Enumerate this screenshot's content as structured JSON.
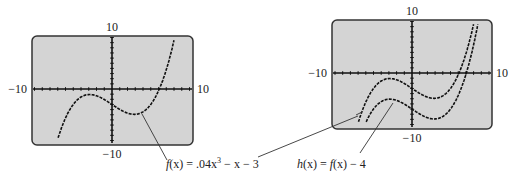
{
  "chart_data": [
    {
      "type": "line",
      "title": "",
      "xlabel": "",
      "ylabel": "",
      "xlim": [
        -10,
        10
      ],
      "ylim": [
        -10,
        10
      ],
      "tick_labels": {
        "x_min": "−10",
        "x_max": "10",
        "y_min": "−10",
        "y_max": "10"
      },
      "grid": false,
      "series": [
        {
          "name": "f(x) = .04x³ − x − 3",
          "expr": "0.04*x^3 - x - 3"
        }
      ],
      "annotations": [
        {
          "text": "f(x) = .04x³ − x − 3",
          "points_to": "f(x) local minimum near (2.9, -4.9)"
        }
      ]
    },
    {
      "type": "line",
      "title": "",
      "xlabel": "",
      "ylabel": "",
      "xlim": [
        -10,
        10
      ],
      "ylim": [
        -10,
        10
      ],
      "tick_labels": {
        "x_min": "−10",
        "x_max": "10",
        "y_min": "−10",
        "y_max": "10"
      },
      "grid": false,
      "series": [
        {
          "name": "f(x)",
          "expr": "0.04*x^3 - x - 3"
        },
        {
          "name": "h(x) = f(x) − 4",
          "expr": "0.04*x^3 - x - 7"
        }
      ],
      "annotations": [
        {
          "text": "h(x) = f(x) − 4",
          "points_to": "h(x) local maximum near (-2.9, -5.1)"
        },
        {
          "text": "f(x) = .04x³ − x − 3",
          "points_to": "f(x) left branch in right screen"
        }
      ]
    }
  ],
  "labels": {
    "left": {
      "top": "10",
      "bottom": "−10",
      "left": "−10",
      "right": "10"
    },
    "right": {
      "top": "10",
      "bottom": "−10",
      "left": "−10",
      "right": "10"
    }
  },
  "captions": {
    "f_prefix": "f",
    "f_rest": "(x) = .04x",
    "f_exp": "3",
    "f_tail": " − x − 3",
    "h_prefix": "h",
    "h_mid": "(x) = ",
    "h_f": "f",
    "h_tail": "(x) − 4"
  },
  "colors": {
    "screen": "#d4d4d4",
    "border": "#333333",
    "curve": "#111111"
  }
}
